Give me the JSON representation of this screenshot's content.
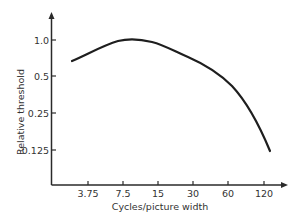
{
  "chart_data": {
    "type": "line",
    "title": "",
    "xlabel": "Cycles/picture width",
    "ylabel": "Relative threshold",
    "x_scale": "log2",
    "y_scale": "log2",
    "x_ticks": [
      "3.75",
      "7.5",
      "15",
      "30",
      "60",
      "120"
    ],
    "y_ticks": [
      "1.0",
      "0.5",
      "0.25",
      "0.125"
    ],
    "xlim": [
      2.5,
      200
    ],
    "ylim": [
      0.08,
      1.7
    ],
    "grid": false,
    "legend": null,
    "series": [
      {
        "name": "Relative threshold",
        "x": [
          2.7,
          4.5,
          8.6,
          19,
          42,
          62,
          90,
          130
        ],
        "y": [
          0.67,
          0.85,
          1.0,
          0.83,
          0.59,
          0.43,
          0.24,
          0.123
        ]
      }
    ]
  },
  "axis": {
    "xlabel": "Cycles/picture width",
    "ylabel": "Relative threshold",
    "x_ticks": [
      {
        "label": "3.75",
        "px": 88
      },
      {
        "label": "7.5",
        "px": 123
      },
      {
        "label": "15",
        "px": 158
      },
      {
        "label": "30",
        "px": 193
      },
      {
        "label": "60",
        "px": 228
      },
      {
        "label": "120",
        "px": 264
      }
    ],
    "y_ticks": [
      {
        "label": "1.0",
        "py": 40
      },
      {
        "label": "0.5",
        "py": 76
      },
      {
        "label": "0.25",
        "py": 113
      },
      {
        "label": "0.125",
        "py": 150
      }
    ]
  },
  "colors": {
    "line": "#1e1e1e",
    "axis": "#2a2a2a",
    "text": "#333333"
  }
}
